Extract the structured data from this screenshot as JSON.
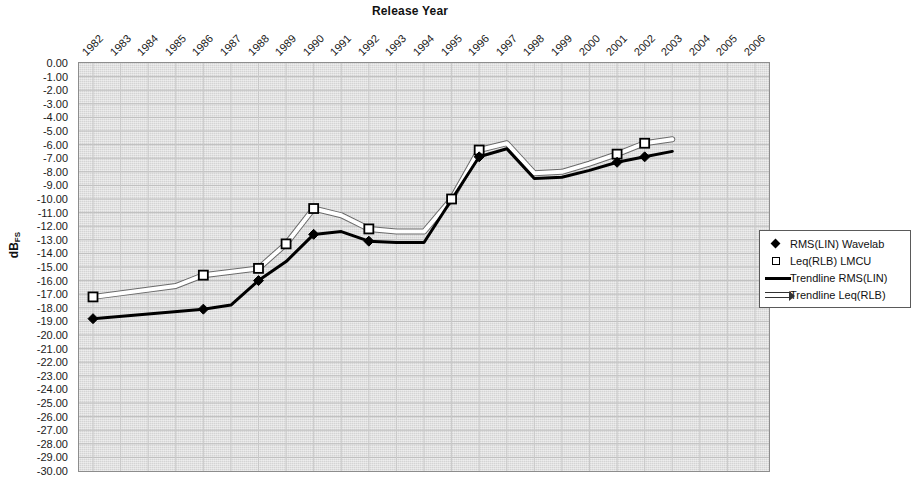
{
  "chart_data": {
    "type": "line",
    "title": "Release Year",
    "xlabel": "Release Year",
    "ylabel": "dBFS",
    "ylabel_main": "dB",
    "ylabel_sub": "FS",
    "grid": true,
    "legend_position": "right",
    "plot_background": "#d4d4d4",
    "x": [
      1982,
      1983,
      1984,
      1985,
      1986,
      1987,
      1988,
      1989,
      1990,
      1991,
      1992,
      1993,
      1994,
      1995,
      1996,
      1997,
      1998,
      1999,
      2000,
      2001,
      2002,
      2003,
      2004,
      2005,
      2006
    ],
    "categories": [
      "1982",
      "1983",
      "1984",
      "1985",
      "1986",
      "1987",
      "1988",
      "1989",
      "1990",
      "1991",
      "1992",
      "1993",
      "1994",
      "1995",
      "1996",
      "1997",
      "1998",
      "1999",
      "2000",
      "2001",
      "2002",
      "2003",
      "2004",
      "2005",
      "2006"
    ],
    "ylim": [
      -30,
      0
    ],
    "ytick_step": 1,
    "yticks": [
      "0.00",
      "-1.00",
      "-2.00",
      "-3.00",
      "-4.00",
      "-5.00",
      "-6.00",
      "-7.00",
      "-8.00",
      "-9.00",
      "-10.00",
      "-11.00",
      "-12.00",
      "-13.00",
      "-14.00",
      "-15.00",
      "-16.00",
      "-17.00",
      "-18.00",
      "-19.00",
      "-20.00",
      "-21.00",
      "-22.00",
      "-23.00",
      "-24.00",
      "-25.00",
      "-26.00",
      "-27.00",
      "-28.00",
      "-29.00",
      "-30.00"
    ],
    "ytick_values": [
      0,
      -1,
      -2,
      -3,
      -4,
      -5,
      -6,
      -7,
      -8,
      -9,
      -10,
      -11,
      -12,
      -13,
      -14,
      -15,
      -16,
      -17,
      -18,
      -19,
      -20,
      -21,
      -22,
      -23,
      -24,
      -25,
      -26,
      -27,
      -28,
      -29,
      -30
    ],
    "series": [
      {
        "name": "RMS(LIN) Wavelab",
        "marker": "filled-diamond",
        "color": "#000000",
        "points": [
          {
            "x": 1982,
            "y": -18.8
          },
          {
            "x": 1986,
            "y": -18.1
          },
          {
            "x": 1988,
            "y": -16.0
          },
          {
            "x": 1990,
            "y": -12.6
          },
          {
            "x": 1992,
            "y": -13.1
          },
          {
            "x": 1996,
            "y": -6.9
          },
          {
            "x": 2001,
            "y": -7.3
          },
          {
            "x": 2002,
            "y": -6.9
          }
        ]
      },
      {
        "name": "Leq(RLB) LMCU",
        "marker": "open-square",
        "color": "#ffffff",
        "points": [
          {
            "x": 1982,
            "y": -17.2
          },
          {
            "x": 1986,
            "y": -15.6
          },
          {
            "x": 1988,
            "y": -15.1
          },
          {
            "x": 1989,
            "y": -13.3
          },
          {
            "x": 1990,
            "y": -10.7
          },
          {
            "x": 1992,
            "y": -12.2
          },
          {
            "x": 1995,
            "y": -10.0
          },
          {
            "x": 1996,
            "y": -6.4
          },
          {
            "x": 2001,
            "y": -6.7
          },
          {
            "x": 2002,
            "y": -5.9
          }
        ]
      },
      {
        "name": "Trendline RMS(LIN)",
        "marker": "line",
        "color": "#000000",
        "points": [
          {
            "x": 1982,
            "y": -18.8
          },
          {
            "x": 1986,
            "y": -18.1
          },
          {
            "x": 1987,
            "y": -17.8
          },
          {
            "x": 1988,
            "y": -16.0
          },
          {
            "x": 1989,
            "y": -14.6
          },
          {
            "x": 1990,
            "y": -12.6
          },
          {
            "x": 1991,
            "y": -12.4
          },
          {
            "x": 1992,
            "y": -13.1
          },
          {
            "x": 1993,
            "y": -13.2
          },
          {
            "x": 1994,
            "y": -13.2
          },
          {
            "x": 1996,
            "y": -6.9
          },
          {
            "x": 1997,
            "y": -6.3
          },
          {
            "x": 1998,
            "y": -8.5
          },
          {
            "x": 1999,
            "y": -8.4
          },
          {
            "x": 2000,
            "y": -7.9
          },
          {
            "x": 2001,
            "y": -7.3
          },
          {
            "x": 2002,
            "y": -6.9
          },
          {
            "x": 2003,
            "y": -6.5
          }
        ]
      },
      {
        "name": "Trendline Leq(RLB)",
        "marker": "line",
        "color": "#ffffff",
        "points": [
          {
            "x": 1982,
            "y": -17.2
          },
          {
            "x": 1985,
            "y": -16.4
          },
          {
            "x": 1986,
            "y": -15.6
          },
          {
            "x": 1988,
            "y": -15.1
          },
          {
            "x": 1989,
            "y": -13.3
          },
          {
            "x": 1990,
            "y": -10.7
          },
          {
            "x": 1991,
            "y": -11.2
          },
          {
            "x": 1992,
            "y": -12.2
          },
          {
            "x": 1993,
            "y": -12.4
          },
          {
            "x": 1994,
            "y": -12.4
          },
          {
            "x": 1995,
            "y": -10.0
          },
          {
            "x": 1996,
            "y": -6.4
          },
          {
            "x": 1997,
            "y": -5.9
          },
          {
            "x": 1998,
            "y": -8.1
          },
          {
            "x": 1999,
            "y": -8.0
          },
          {
            "x": 2000,
            "y": -7.4
          },
          {
            "x": 2001,
            "y": -6.7
          },
          {
            "x": 2002,
            "y": -5.9
          },
          {
            "x": 2003,
            "y": -5.6
          }
        ]
      }
    ]
  },
  "legend": {
    "items": [
      {
        "label": "RMS(LIN) Wavelab",
        "key": "filled-diamond"
      },
      {
        "label": "Leq(RLB) LMCU",
        "key": "open-square"
      },
      {
        "label": "Trendline RMS(LIN)",
        "key": "black-line"
      },
      {
        "label": "Trendline Leq(RLB)",
        "key": "white-line"
      }
    ]
  }
}
